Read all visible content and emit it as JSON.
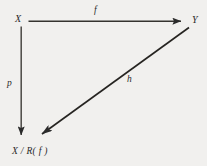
{
  "diagram": {
    "type": "commutative-diagram",
    "background_color": "#f1f0ee",
    "stroke_color": "#2b2b2b",
    "nodes": [
      {
        "id": "X",
        "label": "X",
        "x": 20,
        "y": 19
      },
      {
        "id": "Y",
        "label": "Y",
        "x": 196,
        "y": 20
      },
      {
        "id": "quot",
        "label": "X / R( f )",
        "x": 29,
        "y": 153
      }
    ],
    "arrows": [
      {
        "id": "f",
        "label": "f",
        "from": "X",
        "to": "Y",
        "label_x": 96,
        "label_y": 12
      },
      {
        "id": "p",
        "label": "p",
        "from": "X",
        "to": "quot",
        "label_x": 10,
        "label_y": 85
      },
      {
        "id": "h",
        "label": "h",
        "from": "Y",
        "to": "quot",
        "label_x": 130,
        "label_y": 81
      }
    ]
  }
}
